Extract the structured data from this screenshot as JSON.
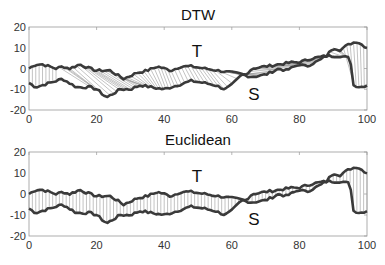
{
  "chart_data": [
    {
      "type": "line",
      "title": "DTW",
      "xlabel": "",
      "ylabel": "",
      "xlim": [
        0,
        100
      ],
      "ylim": [
        -20,
        20
      ],
      "xticks": [
        0,
        20,
        40,
        60,
        80,
        100
      ],
      "yticks": [
        20,
        10,
        0,
        -10,
        -20
      ],
      "grid": false,
      "alignment": "dtw",
      "annotations": [
        {
          "text": "T",
          "x": 55,
          "y": 11
        },
        {
          "text": "S",
          "x": 58,
          "y": -13
        }
      ],
      "series": [
        {
          "name": "T",
          "x": [
            0,
            2,
            4,
            6,
            8,
            10,
            12,
            15,
            18,
            20,
            24,
            28,
            32,
            35,
            38,
            40,
            42,
            45,
            48,
            52,
            56,
            60,
            64,
            66,
            70,
            74,
            78,
            80,
            84,
            88,
            90,
            92,
            95,
            97,
            100
          ],
          "values": [
            0,
            2,
            2,
            1,
            0,
            1,
            0,
            2,
            0,
            -1,
            -1,
            -5,
            -2,
            -1,
            1,
            0,
            -1,
            1,
            1,
            0,
            -1,
            -2,
            -3,
            0,
            1,
            2,
            3,
            3,
            5,
            6,
            10,
            9,
            12,
            13,
            10
          ]
        },
        {
          "name": "S",
          "x": [
            0,
            2,
            4,
            6,
            8,
            10,
            14,
            18,
            20,
            23,
            27,
            30,
            33,
            36,
            40,
            44,
            48,
            52,
            55,
            58,
            60,
            63,
            66,
            70,
            74,
            76,
            80,
            82,
            86,
            88,
            92,
            95,
            96,
            98,
            100
          ],
          "values": [
            -7,
            -9,
            -8,
            -7,
            -6,
            -5,
            -9,
            -9,
            -10,
            -14,
            -10,
            -10,
            -8,
            -9,
            -10,
            -8,
            -6,
            -7,
            -8,
            -10,
            -8,
            -3,
            -4,
            -3,
            0,
            -1,
            2,
            1,
            4,
            6,
            6,
            5,
            -8,
            -9,
            -8
          ]
        }
      ]
    },
    {
      "type": "line",
      "title": "Euclidean",
      "xlabel": "",
      "ylabel": "",
      "xlim": [
        0,
        100
      ],
      "ylim": [
        -20,
        20
      ],
      "xticks": [
        0,
        20,
        40,
        60,
        80,
        100
      ],
      "yticks": [
        20,
        10,
        0,
        -10,
        -20
      ],
      "grid": false,
      "alignment": "euclidean",
      "annotations": [
        {
          "text": "T",
          "x": 55,
          "y": 11
        },
        {
          "text": "S",
          "x": 58,
          "y": -13
        }
      ],
      "series": [
        {
          "name": "T",
          "x": [
            0,
            2,
            4,
            6,
            8,
            10,
            12,
            15,
            18,
            20,
            24,
            28,
            32,
            35,
            38,
            40,
            42,
            45,
            48,
            52,
            56,
            60,
            64,
            66,
            70,
            74,
            78,
            80,
            84,
            88,
            90,
            92,
            95,
            97,
            100
          ],
          "values": [
            0,
            2,
            2,
            1,
            0,
            1,
            0,
            2,
            0,
            -1,
            -1,
            -5,
            -2,
            -1,
            1,
            0,
            -1,
            1,
            1,
            0,
            -1,
            -2,
            -3,
            0,
            1,
            2,
            3,
            3,
            5,
            6,
            10,
            9,
            12,
            13,
            10
          ]
        },
        {
          "name": "S",
          "x": [
            0,
            2,
            4,
            6,
            8,
            10,
            14,
            18,
            20,
            23,
            27,
            30,
            33,
            36,
            40,
            44,
            48,
            52,
            55,
            58,
            60,
            63,
            66,
            70,
            74,
            76,
            80,
            82,
            86,
            88,
            92,
            95,
            96,
            98,
            100
          ],
          "values": [
            -7,
            -9,
            -8,
            -7,
            -6,
            -5,
            -9,
            -9,
            -10,
            -14,
            -10,
            -10,
            -8,
            -9,
            -10,
            -8,
            -6,
            -7,
            -8,
            -10,
            -8,
            -3,
            -4,
            -3,
            0,
            -1,
            2,
            1,
            4,
            6,
            6,
            5,
            -8,
            -9,
            -8
          ]
        }
      ]
    }
  ],
  "panels": [
    {
      "title": "DTW",
      "label_T": "T",
      "label_S": "S"
    },
    {
      "title": "Euclidean",
      "label_T": "T",
      "label_S": "S"
    }
  ],
  "style": {
    "series_color": "#3a3a3a",
    "connector_color": "#9a9a9a",
    "axis_color": "#9a9a9a"
  }
}
